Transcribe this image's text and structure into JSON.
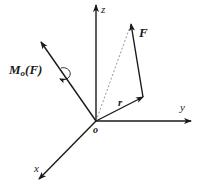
{
  "diagram": {
    "origin": {
      "label": "o",
      "x": 96,
      "y": 121
    },
    "axes": {
      "z": {
        "label": "z",
        "end": [
          96,
          5
        ],
        "label_pos": [
          101,
          13
        ]
      },
      "y": {
        "label": "y",
        "end": [
          191,
          121
        ],
        "label_pos": [
          180,
          111
        ]
      },
      "x": {
        "label": "x",
        "end": [
          39,
          179
        ],
        "label_pos": [
          34,
          170
        ]
      }
    },
    "vectors": {
      "moment": {
        "label_main": "M",
        "label_sub": "o",
        "label_arg": "(F)",
        "end": [
          41,
          42
        ],
        "label_pos": [
          14,
          73
        ]
      },
      "r": {
        "label": "r",
        "end": [
          143,
          97
        ],
        "label_pos": [
          118,
          106
        ]
      },
      "F": {
        "label": "F",
        "start": [
          143,
          97
        ],
        "end": [
          131,
          24
        ],
        "label_pos": [
          138,
          36
        ]
      }
    },
    "dashed_line": {
      "from": [
        96,
        121
      ],
      "to": [
        131,
        24
      ]
    },
    "colors": {
      "stroke": "#1a1a1a",
      "dashed": "#888888"
    }
  }
}
